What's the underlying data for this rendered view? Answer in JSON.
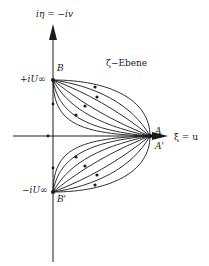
{
  "diagram": {
    "plane_label": "ζ−Ebene",
    "axes": {
      "vertical": {
        "label": "iη = −iv"
      },
      "horizontal": {
        "label": "ξ = u"
      }
    },
    "points": {
      "B": {
        "name": "B",
        "value_label": "+iU∞"
      },
      "B_prime": {
        "name": "B'",
        "value_label": "−iU∞"
      },
      "A": {
        "name": "A"
      },
      "A_prime": {
        "name": "A'"
      }
    },
    "streamlines": {
      "count_per_half": 7,
      "boundary": "semicircle",
      "color": "#1a1a1a"
    }
  }
}
